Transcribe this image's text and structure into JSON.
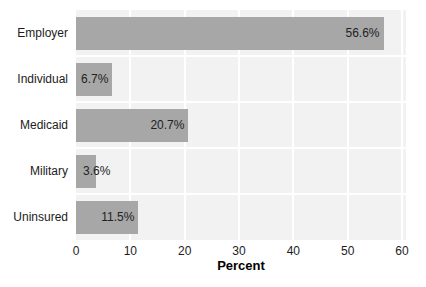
{
  "chart_data": {
    "type": "bar",
    "orientation": "horizontal",
    "title": "",
    "categories": [
      "Employer",
      "Individual",
      "Medicaid",
      "Military",
      "Uninsured"
    ],
    "values": [
      56.6,
      6.7,
      20.7,
      3.6,
      11.5
    ],
    "value_labels": [
      "56.6%",
      "6.7%",
      "20.7%",
      "3.6%",
      "11.5%"
    ],
    "xlabel": "Percent",
    "ylabel": "",
    "xlim": [
      0,
      60
    ],
    "xtick_values": [
      0,
      10,
      20,
      30,
      40,
      50,
      60
    ],
    "xtick_labels": [
      "0",
      "10",
      "20",
      "30",
      "40",
      "50",
      "60"
    ],
    "grid": "white vertical and horizontal gridlines on light gray plot background",
    "legend_position": "none"
  },
  "colors": {
    "bar": "#a7a7a7",
    "plot_background": "#f2f2f2",
    "gridline": "#ffffff",
    "page_background": "#ffffff",
    "text": "#1c1c1c"
  }
}
